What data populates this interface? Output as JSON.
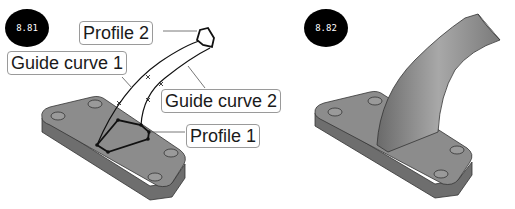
{
  "figures": [
    {
      "id_label": "8.81",
      "labels": {
        "profile_2": "Profile 2",
        "guide_curve_1": "Guide curve 1",
        "guide_curve_2": "Guide curve 2",
        "profile_1": "Profile 1"
      }
    },
    {
      "id_label": "8.82"
    }
  ],
  "colors": {
    "badge_bg": "#000000",
    "badge_text": "#ffffff",
    "plate_top": "#8c8c8c",
    "plate_side": "#6e6e6e",
    "callout_border": "#9a9a9a"
  }
}
